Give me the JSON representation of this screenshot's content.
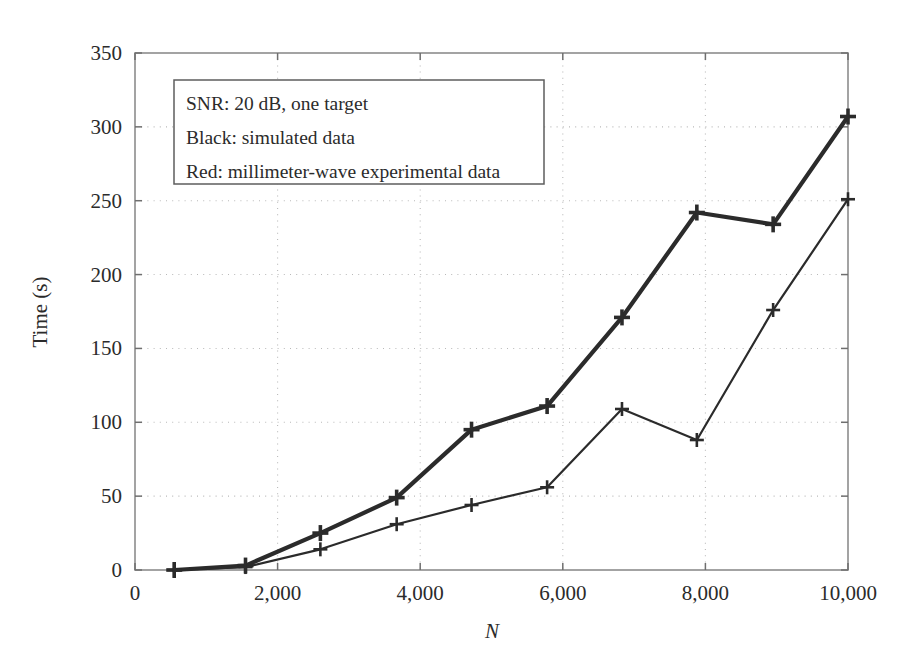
{
  "figure": {
    "background_color": "#ffffff",
    "frame_color": "#8d8d8d",
    "grid_color": "#b9b9b9"
  },
  "chart_data": {
    "type": "line",
    "title": "",
    "xlabel": "N",
    "ylabel": "Time (s)",
    "xlim": [
      0,
      10000
    ],
    "ylim": [
      0,
      350
    ],
    "xticks": [
      0,
      2000,
      4000,
      6000,
      8000,
      10000
    ],
    "xticklabels": [
      "0",
      "2,000",
      "4,000",
      "6,000",
      "8,000",
      "10,000"
    ],
    "yticks": [
      0,
      50,
      100,
      150,
      200,
      250,
      300,
      350
    ],
    "yticklabels": [
      "0",
      "50",
      "100",
      "150",
      "200",
      "250",
      "300",
      "350"
    ],
    "grid": true,
    "grid_style": "dotted",
    "legend_position": "upper-left-inset",
    "x": [
      550,
      1550,
      2600,
      3670,
      4720,
      5780,
      6830,
      7880,
      8950,
      10000
    ],
    "series": [
      {
        "name": "Black: simulated data",
        "color": "#2b2b2b",
        "linewidth": 4.2,
        "marker": "plus",
        "values": [
          0,
          3,
          25,
          49,
          95,
          111,
          171,
          242,
          234,
          307
        ]
      },
      {
        "name": "Red: millimeter-wave experimental data",
        "color": "#2b2b2b",
        "linewidth": 2.2,
        "marker": "plus",
        "values": [
          0,
          2,
          14,
          31,
          44,
          56,
          109,
          88,
          176,
          251
        ]
      }
    ],
    "annotations": [
      "SNR: 20 dB, one target",
      "Black: simulated data",
      "Red: millimeter-wave experimental data"
    ]
  },
  "legend": {
    "lines": [
      "SNR: 20 dB, one target",
      "Black: simulated data",
      "Red: millimeter-wave experimental data"
    ]
  },
  "axes": {
    "x_title": "N",
    "y_title": "Time (s)"
  }
}
